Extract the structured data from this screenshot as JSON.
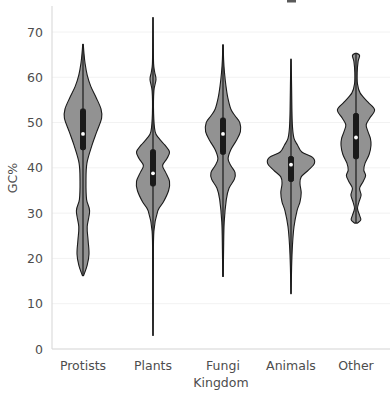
{
  "chart_data": {
    "type": "violin",
    "title": "",
    "xlabel": "Kingdom",
    "ylabel": "GC%",
    "categories": [
      "Protists",
      "Plants",
      "Fungi",
      "Animals",
      "Other"
    ],
    "ylim": [
      0,
      75
    ],
    "yticks": [
      0,
      10,
      20,
      30,
      40,
      50,
      60,
      70
    ],
    "ytick_labels": [
      "0",
      "10",
      "20",
      "30",
      "40",
      "50",
      "60",
      "70"
    ],
    "grid": true,
    "legend": "none",
    "series": [
      {
        "name": "Protists",
        "median": 47.5,
        "q1": 44.0,
        "q3": 53.0,
        "whisker_low": 16.2,
        "whisker_high": 67.3,
        "data_min": 16.2,
        "data_max": 67.3,
        "modes": [
          52.0,
          30.5,
          22.0
        ],
        "density": [
          {
            "v": 16.2,
            "w": 0.02
          },
          {
            "v": 18.5,
            "w": 0.14
          },
          {
            "v": 21.0,
            "w": 0.2
          },
          {
            "v": 24.0,
            "w": 0.17
          },
          {
            "v": 27.0,
            "w": 0.14
          },
          {
            "v": 30.5,
            "w": 0.22
          },
          {
            "v": 33.0,
            "w": 0.12
          },
          {
            "v": 37.0,
            "w": 0.1
          },
          {
            "v": 41.0,
            "w": 0.13
          },
          {
            "v": 45.0,
            "w": 0.3
          },
          {
            "v": 48.0,
            "w": 0.46
          },
          {
            "v": 51.0,
            "w": 0.62
          },
          {
            "v": 53.0,
            "w": 0.6
          },
          {
            "v": 55.5,
            "w": 0.44
          },
          {
            "v": 58.0,
            "w": 0.26
          },
          {
            "v": 60.5,
            "w": 0.14
          },
          {
            "v": 63.0,
            "w": 0.07
          },
          {
            "v": 65.5,
            "w": 0.03
          },
          {
            "v": 67.3,
            "w": 0.01
          }
        ]
      },
      {
        "name": "Plants",
        "median": 38.8,
        "q1": 36.0,
        "q3": 44.0,
        "whisker_low": 3.0,
        "whisker_high": 73.2,
        "data_min": 3.0,
        "data_max": 73.2,
        "modes": [
          43.2,
          36.5
        ],
        "density": [
          {
            "v": 3.0,
            "w": 0.005
          },
          {
            "v": 10.0,
            "w": 0.01
          },
          {
            "v": 18.0,
            "w": 0.012
          },
          {
            "v": 26.0,
            "w": 0.03
          },
          {
            "v": 30.5,
            "w": 0.16
          },
          {
            "v": 32.5,
            "w": 0.35
          },
          {
            "v": 35.0,
            "w": 0.52
          },
          {
            "v": 37.0,
            "w": 0.55
          },
          {
            "v": 39.0,
            "w": 0.42
          },
          {
            "v": 40.5,
            "w": 0.32
          },
          {
            "v": 42.0,
            "w": 0.46
          },
          {
            "v": 43.5,
            "w": 0.55
          },
          {
            "v": 45.0,
            "w": 0.4
          },
          {
            "v": 46.5,
            "w": 0.2
          },
          {
            "v": 48.0,
            "w": 0.07
          },
          {
            "v": 52.0,
            "w": 0.02
          },
          {
            "v": 57.0,
            "w": 0.03
          },
          {
            "v": 59.5,
            "w": 0.1
          },
          {
            "v": 61.0,
            "w": 0.06
          },
          {
            "v": 63.0,
            "w": 0.02
          },
          {
            "v": 68.0,
            "w": 0.01
          },
          {
            "v": 73.2,
            "w": 0.005
          }
        ]
      },
      {
        "name": "Fungi",
        "median": 47.5,
        "q1": 43.0,
        "q3": 51.0,
        "whisker_low": 16.0,
        "whisker_high": 67.2,
        "data_min": 16.0,
        "data_max": 67.2,
        "modes": [
          48.5,
          38.5
        ],
        "density": [
          {
            "v": 16.0,
            "w": 0.01
          },
          {
            "v": 22.0,
            "w": 0.02
          },
          {
            "v": 28.0,
            "w": 0.04
          },
          {
            "v": 33.0,
            "w": 0.11
          },
          {
            "v": 35.5,
            "w": 0.2
          },
          {
            "v": 37.5,
            "w": 0.38
          },
          {
            "v": 39.0,
            "w": 0.4
          },
          {
            "v": 40.5,
            "w": 0.26
          },
          {
            "v": 42.0,
            "w": 0.17
          },
          {
            "v": 44.0,
            "w": 0.26
          },
          {
            "v": 46.0,
            "w": 0.44
          },
          {
            "v": 48.0,
            "w": 0.58
          },
          {
            "v": 50.0,
            "w": 0.56
          },
          {
            "v": 51.5,
            "w": 0.4
          },
          {
            "v": 53.0,
            "w": 0.26
          },
          {
            "v": 55.5,
            "w": 0.16
          },
          {
            "v": 58.0,
            "w": 0.1
          },
          {
            "v": 61.0,
            "w": 0.05
          },
          {
            "v": 64.0,
            "w": 0.02
          },
          {
            "v": 67.2,
            "w": 0.01
          }
        ]
      },
      {
        "name": "Animals",
        "median": 40.7,
        "q1": 37.0,
        "q3": 42.5,
        "whisker_low": 12.2,
        "whisker_high": 64.0,
        "data_min": 12.2,
        "data_max": 64.0,
        "modes": [
          41.0,
          35.0
        ],
        "density": [
          {
            "v": 12.2,
            "w": 0.005
          },
          {
            "v": 18.0,
            "w": 0.02
          },
          {
            "v": 23.0,
            "w": 0.05
          },
          {
            "v": 27.0,
            "w": 0.1
          },
          {
            "v": 30.5,
            "w": 0.2
          },
          {
            "v": 32.5,
            "w": 0.3
          },
          {
            "v": 34.5,
            "w": 0.34
          },
          {
            "v": 36.5,
            "w": 0.3
          },
          {
            "v": 38.0,
            "w": 0.34
          },
          {
            "v": 39.5,
            "w": 0.58
          },
          {
            "v": 41.0,
            "w": 0.78
          },
          {
            "v": 42.3,
            "w": 0.72
          },
          {
            "v": 43.5,
            "w": 0.36
          },
          {
            "v": 45.0,
            "w": 0.22
          },
          {
            "v": 46.5,
            "w": 0.1
          },
          {
            "v": 49.0,
            "w": 0.05
          },
          {
            "v": 53.0,
            "w": 0.03
          },
          {
            "v": 58.0,
            "w": 0.02
          },
          {
            "v": 64.0,
            "w": 0.005
          }
        ]
      },
      {
        "name": "Other",
        "median": 46.7,
        "q1": 42.0,
        "q3": 52.0,
        "whisker_low": 27.8,
        "whisker_high": 65.3,
        "data_min": 27.8,
        "data_max": 65.3,
        "modes": [
          53.0,
          46.0,
          38.0,
          34.0,
          28.2
        ],
        "density": [
          {
            "v": 27.8,
            "w": 0.05
          },
          {
            "v": 28.5,
            "w": 0.16
          },
          {
            "v": 29.5,
            "w": 0.12
          },
          {
            "v": 31.0,
            "w": 0.05
          },
          {
            "v": 32.5,
            "w": 0.1
          },
          {
            "v": 34.0,
            "w": 0.17
          },
          {
            "v": 35.5,
            "w": 0.12
          },
          {
            "v": 37.0,
            "w": 0.24
          },
          {
            "v": 38.3,
            "w": 0.32
          },
          {
            "v": 39.5,
            "w": 0.26
          },
          {
            "v": 41.0,
            "w": 0.3
          },
          {
            "v": 43.0,
            "w": 0.44
          },
          {
            "v": 45.0,
            "w": 0.5
          },
          {
            "v": 46.5,
            "w": 0.48
          },
          {
            "v": 48.0,
            "w": 0.4
          },
          {
            "v": 49.5,
            "w": 0.34
          },
          {
            "v": 51.0,
            "w": 0.46
          },
          {
            "v": 52.8,
            "w": 0.62
          },
          {
            "v": 54.5,
            "w": 0.4
          },
          {
            "v": 56.5,
            "w": 0.14
          },
          {
            "v": 58.5,
            "w": 0.05
          },
          {
            "v": 61.0,
            "w": 0.04
          },
          {
            "v": 63.5,
            "w": 0.07
          },
          {
            "v": 64.8,
            "w": 0.12
          },
          {
            "v": 65.3,
            "w": 0.02
          }
        ]
      }
    ]
  },
  "axis": {
    "y_title": "GC%",
    "x_title": "Kingdom"
  },
  "colors": {
    "violin_fill": "#8c8c8c",
    "violin_edge": "#1a1a1a",
    "grid": "#f2f2f2",
    "text": "#4d4d4d",
    "background": "#ffffff",
    "median_dot": "#ffffff"
  }
}
